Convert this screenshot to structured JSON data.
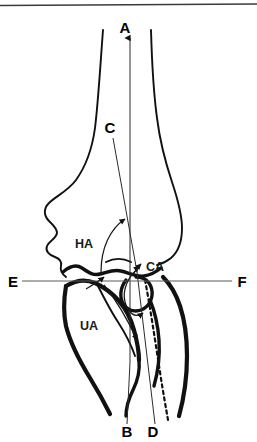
{
  "figure": {
    "background_color": "#ffffff",
    "line_color": "#111111",
    "reference_line_color": "#5a5a5a",
    "width": 257,
    "height": 442
  },
  "axis_labels": [
    {
      "id": "A",
      "text": "A",
      "x": 131,
      "y": 30,
      "role": "humeral-shaft-axis-top"
    },
    {
      "id": "B",
      "text": "B",
      "x": 128,
      "y": 436,
      "role": "ulnar-shaft-axis-bottom"
    },
    {
      "id": "C",
      "text": "C",
      "x": 110,
      "y": 130,
      "role": "humeral-condyle-axis-top"
    },
    {
      "id": "D",
      "text": "D",
      "x": 152,
      "y": 436,
      "role": "forearm-axis-bottom"
    },
    {
      "id": "E",
      "text": "E",
      "x": 13,
      "y": 285,
      "role": "joint-reference-line-left"
    },
    {
      "id": "F",
      "text": "F",
      "x": 241,
      "y": 285,
      "role": "joint-reference-line-right"
    }
  ],
  "angle_labels": [
    {
      "id": "HA",
      "text": "HA",
      "x": 84,
      "y": 246,
      "role": "humeral-angle"
    },
    {
      "id": "CA",
      "text": "CA",
      "x": 147,
      "y": 269,
      "role": "carrying-angle"
    },
    {
      "id": "UA",
      "text": "UA",
      "x": 88,
      "y": 327,
      "role": "ulnar-angle"
    }
  ]
}
